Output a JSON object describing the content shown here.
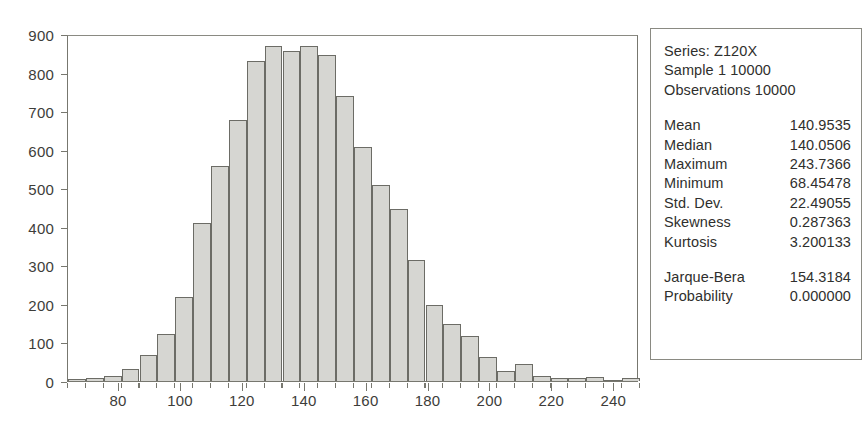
{
  "chart_data": {
    "type": "bar",
    "title": "",
    "xlabel": "",
    "ylabel": "",
    "xlim": [
      63.5,
      248.0
    ],
    "ylim": [
      0,
      900
    ],
    "grid": false,
    "legend": "none",
    "y_ticks": [
      0,
      100,
      200,
      300,
      400,
      500,
      600,
      700,
      800,
      900
    ],
    "x_ticks": [
      80,
      100,
      120,
      140,
      160,
      180,
      200,
      220,
      240
    ],
    "bin_width": 5.77,
    "bin_centers": [
      66.4,
      72.2,
      78.0,
      83.7,
      89.5,
      95.3,
      101.1,
      106.8,
      112.6,
      118.4,
      124.2,
      129.9,
      135.7,
      141.5,
      147.3,
      153.0,
      158.8,
      164.6,
      170.4,
      176.1,
      181.9,
      187.7,
      193.5,
      199.2,
      205.0,
      210.8,
      216.6,
      222.3,
      228.1,
      233.9,
      239.7,
      245.4
    ],
    "categories": [
      "66.4",
      "72.2",
      "78.0",
      "83.7",
      "89.5",
      "95.3",
      "101.1",
      "106.8",
      "112.6",
      "118.4",
      "124.2",
      "129.9",
      "135.7",
      "141.5",
      "147.3",
      "153.0",
      "158.8",
      "164.6",
      "170.4",
      "176.1",
      "181.9",
      "187.7",
      "193.5",
      "199.2",
      "205.0",
      "210.8",
      "216.6",
      "222.3",
      "228.1",
      "233.9",
      "239.7",
      "245.4"
    ],
    "values": [
      4,
      8,
      12,
      30,
      68,
      122,
      218,
      410,
      558,
      678,
      830,
      870,
      855,
      870,
      845,
      740,
      608,
      508,
      445,
      313,
      196,
      148,
      118,
      62,
      25,
      45,
      14,
      8,
      8,
      10,
      0,
      7
    ],
    "series": [
      {
        "name": "Z120X frequency",
        "values": [
          4,
          8,
          12,
          30,
          68,
          122,
          218,
          410,
          558,
          678,
          830,
          870,
          855,
          870,
          845,
          740,
          608,
          508,
          445,
          313,
          196,
          148,
          118,
          62,
          25,
          45,
          14,
          8,
          8,
          10,
          0,
          7
        ]
      }
    ]
  },
  "stats": {
    "header": [
      "Series: Z120X",
      "Sample 1 10000",
      "Observations 10000"
    ],
    "rows": [
      {
        "label": "Mean",
        "value": "140.9535"
      },
      {
        "label": "Median",
        "value": "140.0506"
      },
      {
        "label": "Maximum",
        "value": "243.7366"
      },
      {
        "label": "Minimum",
        "value": "68.45478"
      },
      {
        "label": "Std. Dev.",
        "value": "22.49055"
      },
      {
        "label": "Skewness",
        "value": "0.287363"
      },
      {
        "label": "Kurtosis",
        "value": "3.200133"
      }
    ],
    "tests": [
      {
        "label": "Jarque-Bera",
        "value": "154.3184"
      },
      {
        "label": "Probability",
        "value": "0.000000"
      }
    ]
  },
  "colors": {
    "bar_fill": "#d6d6d2",
    "bar_border": "#6c6c66",
    "axis": "#77776f",
    "text": "#2f2f2d",
    "background": "#ffffff"
  }
}
